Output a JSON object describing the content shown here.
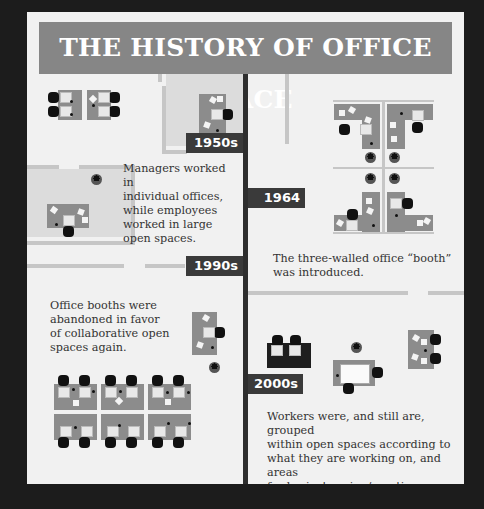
{
  "title": "THE HISTORY OF OFFICE SPACE",
  "colors": {
    "background": "#1c1c1c",
    "panel": "#f1f1f1",
    "title_banner": "#868686",
    "timeline": "#2e2e2e",
    "era_label": "#3a3a3a",
    "desk": "#8c8c8c",
    "wall": "#c6c6c6",
    "text": "#333333"
  },
  "timeline": [
    {
      "era": "1950s",
      "description": "Managers worked in individual offices, while employees worked in large open spaces."
    },
    {
      "era": "1964",
      "description": "The three-walled office “booth” was introduced."
    },
    {
      "era": "1990s",
      "description": "Office booths were abandoned in favor of collaborative open spaces again."
    },
    {
      "era": "2000s",
      "description": "Workers were, and still are, grouped within open spaces according to what they are working on, and areas for brainstorming/creative thinking are introduced around these groups."
    }
  ],
  "description_lines": {
    "e1950s": [
      "Managers worked in",
      "individual offices,",
      "while employees",
      "worked in large",
      "open spaces."
    ],
    "e1964": [
      "The three-walled office “booth”",
      "was introduced."
    ],
    "e1990s": [
      "Office booths were",
      "abandoned in favor",
      "of collaborative open",
      "spaces again."
    ],
    "e2000s": [
      "Workers were, and still are, grouped",
      "within open spaces according to",
      "what they are working on, and areas",
      "for brainstorming/creative thinking",
      "are introduced around these groups."
    ]
  }
}
